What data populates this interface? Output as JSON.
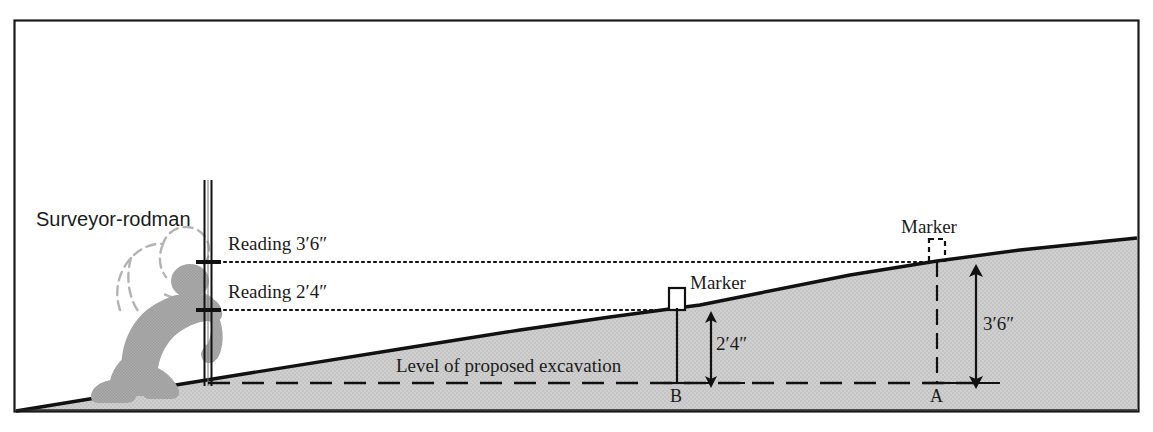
{
  "diagram": {
    "title_caption": "Surveying level cross-section",
    "type": "engineering-cross-section",
    "border_color": "#1a1a1a",
    "ground_fill": "#cfcfcf",
    "ground_line_color": "#111111",
    "figure_color": "#a9a9a9",
    "text_color": "#1b1b1b"
  },
  "labels": {
    "surveyor": "Surveyor-rodman",
    "reading_upper": "Reading 3′6″",
    "reading_lower": "Reading 2′4″",
    "marker_b": "Marker",
    "marker_a": "Marker",
    "excavation": "Level of proposed excavation",
    "dim_b": "2′4″",
    "dim_a": "3′6″",
    "point_b": "B",
    "point_a": "A"
  },
  "measurements": {
    "station_b": {
      "point": "B",
      "depth": "2′4″",
      "rod_reading": "2′4″"
    },
    "station_a": {
      "point": "A",
      "depth": "3′6″",
      "rod_reading": "3′6″"
    }
  },
  "geometry": {
    "frame": {
      "x": 14,
      "y": 20,
      "w": 1125,
      "h": 392
    },
    "rod": {
      "x": 208,
      "top": 180,
      "bottom": 385
    },
    "sight_upper_y": 262,
    "sight_lower_y": 310,
    "excavation_y": 383,
    "marker_b_x": 677,
    "marker_a_x": 937,
    "ground_left": {
      "x": 16,
      "y": 411
    },
    "ground_right": {
      "x": 1138,
      "y": 238
    }
  }
}
